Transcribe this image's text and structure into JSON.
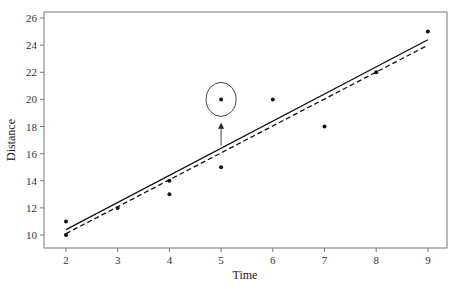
{
  "chart_data": {
    "type": "scatter",
    "title": "",
    "xlabel": "Time",
    "ylabel": "Distance",
    "xlim": [
      1.6,
      9.4
    ],
    "ylim": [
      9.0,
      26.3
    ],
    "xticks": [
      2,
      3,
      4,
      5,
      6,
      7,
      8,
      9
    ],
    "yticks": [
      10,
      12,
      14,
      16,
      18,
      20,
      22,
      24,
      26
    ],
    "grid": false,
    "points": [
      {
        "x": 2,
        "y": 11
      },
      {
        "x": 2,
        "y": 10
      },
      {
        "x": 3,
        "y": 12
      },
      {
        "x": 4,
        "y": 14
      },
      {
        "x": 4,
        "y": 13
      },
      {
        "x": 5,
        "y": 20,
        "highlighted": true
      },
      {
        "x": 5,
        "y": 15
      },
      {
        "x": 6,
        "y": 20
      },
      {
        "x": 7,
        "y": 18
      },
      {
        "x": 8,
        "y": 22
      },
      {
        "x": 9,
        "y": 25
      }
    ],
    "lines": [
      {
        "name": "fit-with-outlier",
        "style": "solid",
        "x": [
          2,
          9
        ],
        "y": [
          10.4,
          24.4
        ]
      },
      {
        "name": "fit-without-outlier",
        "style": "dashed",
        "x": [
          2,
          9
        ],
        "y": [
          10.1,
          24.0
        ]
      }
    ],
    "annotations": [
      {
        "type": "circle",
        "x": 5,
        "y": 20,
        "label": ""
      },
      {
        "type": "arrow",
        "from": {
          "x": 5,
          "y": 16.6
        },
        "to": {
          "x": 5,
          "y": 18.2
        },
        "label": ""
      }
    ]
  }
}
